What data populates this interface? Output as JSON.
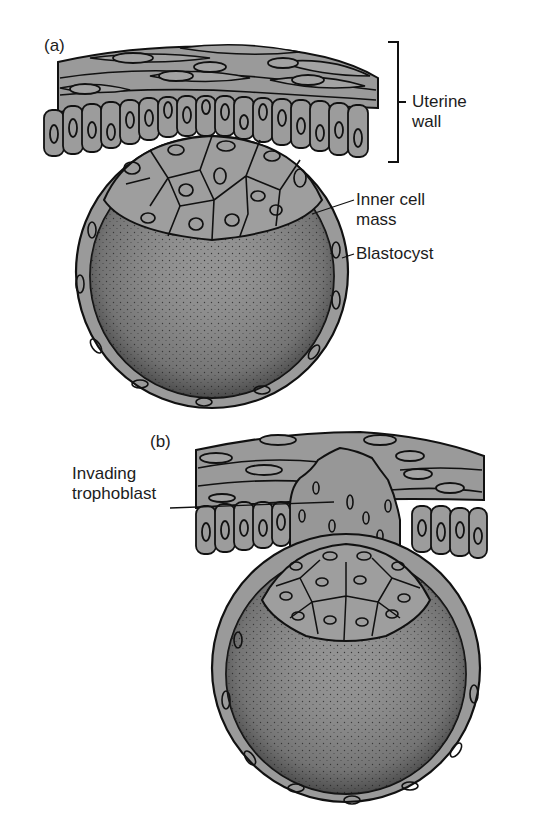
{
  "figure": {
    "panels": [
      {
        "id": "a",
        "label": "(a)",
        "annotations": {
          "uterine_wall": "Uterine\nwall",
          "inner_cell_mass": "Inner cell\nmass",
          "blastocyst": "Blastocyst"
        }
      },
      {
        "id": "b",
        "label": "(b)",
        "annotations": {
          "invading_trophoblast": "Invading\ntrophoblast"
        }
      }
    ],
    "colors": {
      "background": "#ffffff",
      "cell_fill": "#9a9a9a",
      "cell_fill_dark": "#8a8a8a",
      "cavity_fill": "#8f8f8f",
      "outline": "#111111",
      "text": "#1c1c1c"
    }
  }
}
